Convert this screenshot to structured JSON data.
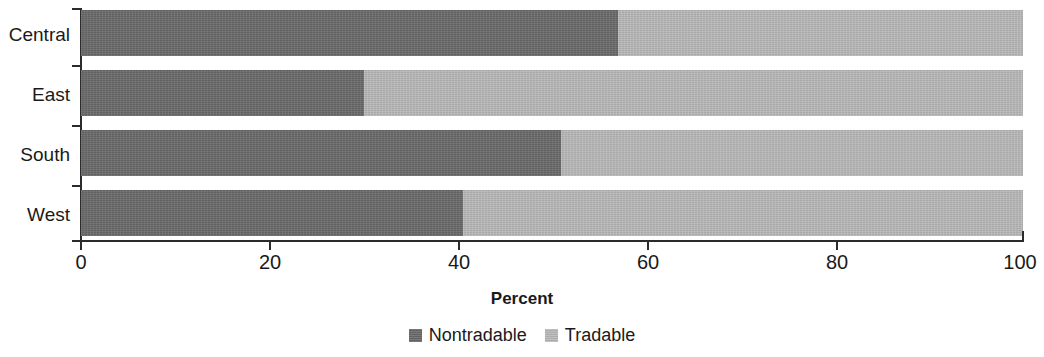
{
  "chart_data": {
    "type": "bar",
    "orientation": "horizontal",
    "stacked": true,
    "stack_mode": "percent",
    "title": "",
    "xlabel": "Percent",
    "ylabel": "",
    "xlim": [
      0,
      100
    ],
    "xticks": [
      0,
      20,
      40,
      60,
      80,
      100
    ],
    "xtick_labels": [
      "0",
      "20",
      "40",
      "60",
      "80",
      "100"
    ],
    "grid": false,
    "legend_position": "bottom-center",
    "categories": [
      "Central",
      "East",
      "South",
      "West"
    ],
    "series": [
      {
        "name": "Nontradable",
        "color": "#6a6a6a",
        "values": [
          57,
          30,
          51,
          40.5
        ]
      },
      {
        "name": "Tradable",
        "color": "#b9b9b9",
        "values": [
          43,
          70,
          49,
          59.5
        ]
      }
    ]
  },
  "axis": {
    "x_title": "Percent"
  },
  "legend": {
    "items": [
      {
        "label": "Nontradable",
        "color": "#6a6a6a"
      },
      {
        "label": "Tradable",
        "color": "#b9b9b9"
      }
    ]
  },
  "colors": {
    "nontradable": "#6a6a6a",
    "tradable": "#b9b9b9",
    "axis": "#2b2b2b",
    "text": "#1a1a1a",
    "background": "#ffffff"
  }
}
